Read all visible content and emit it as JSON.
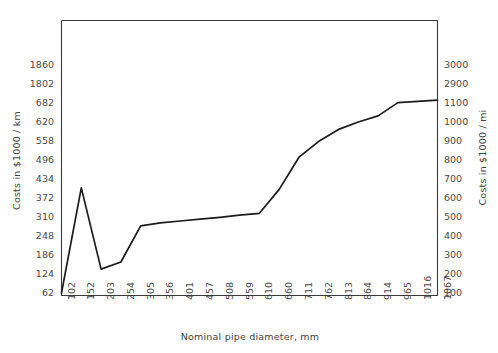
{
  "chart_data": {
    "type": "line",
    "title": "",
    "xlabel": "Nominal pipe diameter, mm",
    "ylabel": "Costs in $1000 / km",
    "ylabel_secondary": "Costs in $1000 / mi",
    "grid": false,
    "legend": "none",
    "categories": [
      "102",
      "152",
      "203",
      "254",
      "305",
      "356",
      "401",
      "457",
      "508",
      "559",
      "610",
      "660",
      "711",
      "762",
      "813",
      "864",
      "914",
      "965",
      "1016",
      "1067"
    ],
    "yticks_left": [
      "62",
      "124",
      "186",
      "248",
      "310",
      "372",
      "434",
      "496",
      "558",
      "620",
      "682",
      "1802",
      "1860"
    ],
    "yticks_right": [
      "100",
      "200",
      "300",
      "400",
      "500",
      "600",
      "700",
      "800",
      "900",
      "1000",
      "1100",
      "2900",
      "3000"
    ],
    "ylim_left": [
      62,
      1860
    ],
    "ylim_right": [
      100,
      3000
    ],
    "series": [
      {
        "name": "Pipeline cost",
        "values": [
          62,
          405,
          140,
          163,
          281,
          291,
          297,
          303,
          309,
          316,
          322,
          400,
          505,
          557,
          596,
          620,
          640,
          705,
          780,
          845
        ]
      }
    ],
    "axis_color": "#3a3a3a",
    "line_color": "#1c1c1c"
  }
}
